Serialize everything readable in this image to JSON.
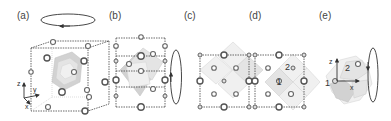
{
  "figure": {
    "panels": [
      {
        "id": "a",
        "label": "(a)",
        "description": "3D perspective view of cubic unit cell with octahedra and rotation arrow about vertical axis",
        "axes": [
          "z",
          "y",
          "x"
        ]
      },
      {
        "id": "b",
        "label": "(b)",
        "description": "Rotated view of unit cell with rotation arrow about vertical axis"
      },
      {
        "id": "c",
        "label": "(c)",
        "description": "Projection along axis showing four octahedra in diamond arrangement"
      },
      {
        "id": "d",
        "label": "(d)",
        "description": "Projection with two labeled octahedra",
        "site_labels": [
          "1",
          "2"
        ]
      },
      {
        "id": "e",
        "label": "(e)",
        "description": "Isolated pair of octahedra with local axes and rotation arrow",
        "axes": [
          "z",
          "x"
        ],
        "site_labels": [
          "1",
          "2"
        ]
      }
    ],
    "colors": {
      "line": "#444444",
      "atom_outline": "#555555",
      "octahedron_fill": "#e4e4e4",
      "background": "#ffffff"
    }
  }
}
